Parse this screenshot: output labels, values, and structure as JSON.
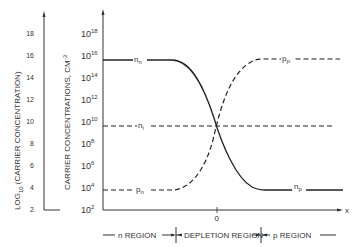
{
  "chart_data": {
    "type": "line",
    "title": "",
    "xlabel": "x",
    "x_tick_labels": [
      "0"
    ],
    "ylabel_left": "LOG10 (CARRIER CONCENTRATION)",
    "ylabel_right": "CARRIER CONCENTRATIONS, CM-3",
    "left_ticks": [
      "18",
      "16",
      "14",
      "12",
      "10",
      "8",
      "6",
      "4",
      "2"
    ],
    "right_ticks": [
      {
        "base": "10",
        "exp": "18"
      },
      {
        "base": "10",
        "exp": "16"
      },
      {
        "base": "10",
        "exp": "14"
      },
      {
        "base": "10",
        "exp": "12"
      },
      {
        "base": "10",
        "exp": "10"
      },
      {
        "base": "10",
        "exp": "8"
      },
      {
        "base": "10",
        "exp": "6"
      },
      {
        "base": "10",
        "exp": "4"
      },
      {
        "base": "10",
        "exp": "2"
      }
    ],
    "ylim_log10": [
      2,
      19
    ],
    "series": [
      {
        "name": "n_n",
        "label_main": "n",
        "label_sub": "n",
        "style": "solid",
        "description": "electron concentration: 10^16 in n region, falls through depletion region to 10^4 in p region",
        "log10_values": {
          "n_region": 16,
          "x0": 10,
          "p_region": 4
        }
      },
      {
        "name": "p_p",
        "label_main": "p",
        "label_sub": "p",
        "style": "dashed",
        "description": "hole concentration: 10^4 in n region (p_n), rises through depletion region to 10^16 in p region",
        "log10_values": {
          "n_region": 4,
          "x0": 10,
          "p_region": 16
        }
      },
      {
        "name": "n_i",
        "label_main": "n",
        "label_sub": "i",
        "style": "dash-dot",
        "description": "intrinsic concentration, constant",
        "log10_values": {
          "n_region": 10,
          "x0": 10,
          "p_region": 10
        }
      },
      {
        "name": "p_n",
        "label_main": "p",
        "label_sub": "n",
        "style": "dashed"
      },
      {
        "name": "n_p",
        "label_main": "n",
        "label_sub": "p",
        "style": "solid"
      }
    ],
    "regions": [
      "n REGION",
      "DEPLETION REGION",
      "p REGION"
    ],
    "grid": false,
    "legend": "inline labels"
  },
  "labels": {
    "nn_main": "n",
    "nn_sub": "n",
    "ni_main": "n",
    "ni_sub": "i",
    "pn_main": "p",
    "pn_sub": "n",
    "pp_main": "p",
    "pp_sub": "p",
    "np_main": "n",
    "np_sub": "p",
    "x_axis": "x",
    "zero": "0",
    "region_n": "n REGION",
    "region_depletion": "DEPLETION REGION",
    "region_p": "p REGION",
    "ylabel_left_pre": "LOG",
    "ylabel_left_sub": "10",
    "ylabel_left_post": " (CARRIER CONCENTRATION)",
    "ylabel_right_pre": "CARRIER CONCENTRATIONS, CM",
    "ylabel_right_sup": "-3"
  },
  "colors": {
    "ink": "#2a2a2a",
    "background": "#ffffff"
  }
}
